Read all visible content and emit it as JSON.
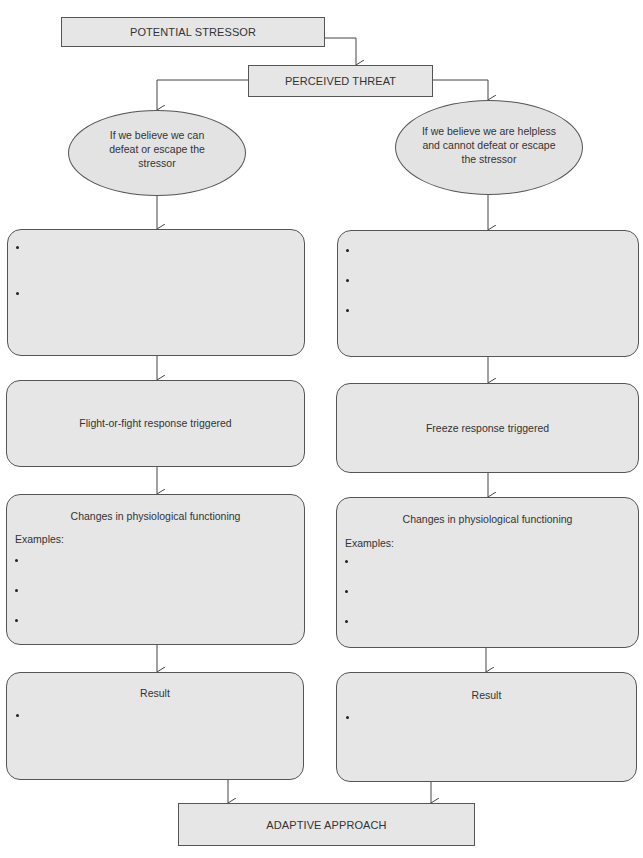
{
  "page_header": {
    "partial_text": "Figure: diagram flow of response pathway"
  },
  "nodes": {
    "potential_stressor": "POTENTIAL STRESSOR",
    "perceived_threat": "PERCEIVED THREAT",
    "left_condition": "If we believe we can defeat or escape the stressor",
    "right_condition": "If we believe we are helpless and cannot defeat or escape the stressor",
    "left_response": "Flight-or-fight response triggered",
    "right_response": "Freeze response triggered",
    "left_changes_title": "Changes in physiological functioning",
    "right_changes_title": "Changes in physiological functioning",
    "examples_label": "Examples:",
    "left_result_title": "Result",
    "right_result_title": "Result",
    "adaptive_approach": "ADAPTIVE APPROACH"
  },
  "bullets": {
    "left_box1": [
      "",
      ""
    ],
    "right_box1": [
      "",
      "",
      ""
    ],
    "left_changes": [
      "",
      "",
      ""
    ],
    "right_changes": [
      "",
      "",
      ""
    ],
    "left_result": [
      ""
    ],
    "right_result": [
      ""
    ]
  },
  "colors": {
    "box_fill": "#e6e6e6",
    "stroke": "#555555"
  }
}
